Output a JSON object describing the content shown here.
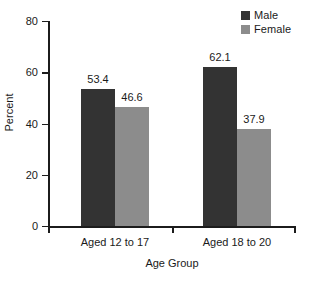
{
  "chart_data": {
    "type": "bar",
    "title": "",
    "xlabel": "Age Group",
    "ylabel": "Percent",
    "categories": [
      "Aged 12 to 17",
      "Aged 18 to 20"
    ],
    "series": [
      {
        "name": "Male",
        "values": [
          53.4,
          62.1
        ],
        "color": "#333333"
      },
      {
        "name": "Female",
        "values": [
          46.6,
          37.9
        ],
        "color": "#8c8c8c"
      }
    ],
    "ylim": [
      0,
      80
    ],
    "yticks": [
      0,
      20,
      40,
      60,
      80
    ],
    "ytick_labels": [
      "0",
      "20",
      "40",
      "60",
      "80"
    ],
    "grid": false,
    "legend_position": "top-right",
    "data_labels": [
      "53.4",
      "46.6",
      "62.1",
      "37.9"
    ]
  },
  "legend": {
    "items": [
      {
        "label": "Male",
        "swatch_name": "legend-swatch-male"
      },
      {
        "label": "Female",
        "swatch_name": "legend-swatch-female"
      }
    ]
  },
  "axes": {
    "y_title": "Percent",
    "x_title": "Age Group",
    "y_labels": [
      "80",
      "60",
      "40",
      "20",
      "0"
    ],
    "x_labels": [
      "Aged 12 to 17",
      "Aged 18 to 20"
    ]
  },
  "bars": [
    {
      "value_label": "53.4",
      "series": "Male",
      "category": "Aged 12 to 17"
    },
    {
      "value_label": "46.6",
      "series": "Female",
      "category": "Aged 12 to 17"
    },
    {
      "value_label": "62.1",
      "series": "Male",
      "category": "Aged 18 to 20"
    },
    {
      "value_label": "37.9",
      "series": "Female",
      "category": "Aged 18 to 20"
    }
  ]
}
